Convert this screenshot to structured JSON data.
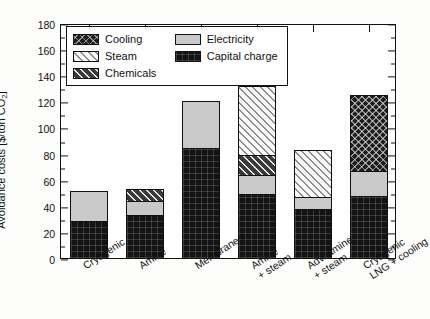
{
  "chart_data": {
    "type": "bar",
    "subtype": "stacked-bar",
    "title": "",
    "xlabel": "",
    "ylabel": "Avoidance costs [$/ton CO2]",
    "ylabel_prefix": "Avoidance costs [$/ton CO",
    "ylabel_sub": "2",
    "ylabel_suffix": "]",
    "ylim": [
      0,
      180
    ],
    "ytick_step": 20,
    "yminor_step": 10,
    "grid": false,
    "legend_position": "upper-left-inside",
    "categories": [
      "Cryogenic",
      "Amine",
      "Membranes",
      "Amine\n+ steam",
      "Adv. amine\n+ steam",
      "Cryogenic\nLNG + cooling"
    ],
    "yticks": [
      0,
      20,
      40,
      60,
      80,
      100,
      120,
      140,
      160,
      180
    ],
    "series": [
      {
        "name": "Capital charge",
        "pattern": "solid-black",
        "color": "#131313",
        "values": [
          29,
          34,
          85,
          50,
          38,
          48
        ]
      },
      {
        "name": "Electricity",
        "pattern": "solid-gray",
        "color": "#c9c9c9",
        "values": [
          24,
          11,
          37,
          15,
          10,
          20
        ]
      },
      {
        "name": "Chemicals",
        "pattern": "dark-diagonal-hatch",
        "color": "#3a3a3a",
        "values": [
          0,
          10,
          0,
          16,
          0,
          0
        ]
      },
      {
        "name": "Steam",
        "pattern": "light-diagonal-hatch",
        "color": "#fafafa",
        "values": [
          0,
          0,
          0,
          54,
          37,
          0
        ]
      },
      {
        "name": "Cooling",
        "pattern": "dark-cross-hatch",
        "color": "#1d1d1d",
        "values": [
          0,
          0,
          0,
          0,
          0,
          59
        ]
      }
    ],
    "totals": [
      53,
      55,
      122,
      135,
      85,
      127
    ]
  },
  "legend": {
    "entries": [
      {
        "label": "Cooling",
        "fill": "fill-cooling"
      },
      {
        "label": "Electricity",
        "fill": "fill-electricity"
      },
      {
        "label": "Steam",
        "fill": "fill-steam"
      },
      {
        "label": "Capital charge",
        "fill": "fill-capital"
      },
      {
        "label": "Chemicals",
        "fill": "fill-chemicals"
      }
    ]
  }
}
